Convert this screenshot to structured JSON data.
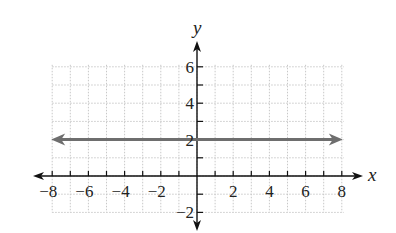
{
  "chart_data": {
    "type": "line",
    "title": "",
    "xlabel": "x",
    "ylabel": "y",
    "xlim": [
      -8,
      8
    ],
    "ylim": [
      -2,
      6
    ],
    "grid": true,
    "x_ticks": [
      -8,
      -7,
      -6,
      -5,
      -4,
      -3,
      -2,
      -1,
      0,
      1,
      2,
      3,
      4,
      5,
      6,
      7,
      8
    ],
    "x_tick_labels": [
      "−8",
      "−6",
      "−4",
      "−2",
      "2",
      "4",
      "6",
      "8"
    ],
    "x_tick_label_values": [
      -8,
      -6,
      -4,
      -2,
      2,
      4,
      6,
      8
    ],
    "y_ticks": [
      -2,
      -1,
      0,
      1,
      2,
      3,
      4,
      5,
      6
    ],
    "y_tick_labels": [
      "−2",
      "2",
      "4",
      "6"
    ],
    "y_tick_label_values": [
      -2,
      2,
      4,
      6
    ],
    "series": [
      {
        "name": "y = 2",
        "equation": "y = 2",
        "x": [
          -8,
          8
        ],
        "y": [
          2,
          2
        ],
        "color": "#6e6e6e",
        "arrows": "both"
      }
    ],
    "legend": null
  },
  "colors": {
    "axis": "#111111",
    "grid": "#c8c8c8",
    "line": "#6e6e6e"
  }
}
